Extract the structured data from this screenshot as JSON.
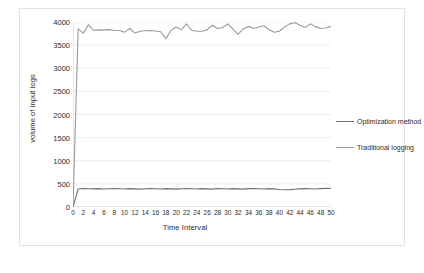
{
  "chart_data": {
    "type": "line",
    "title": "",
    "xlabel": "Time Interval",
    "ylabel": "volume of input logs",
    "xlim": [
      0,
      50
    ],
    "ylim": [
      0,
      4000
    ],
    "ytick_step": 500,
    "xtick_step": 2,
    "grid": true,
    "legend_position": "right",
    "yticks": [
      0,
      500,
      1000,
      1500,
      2000,
      2500,
      3000,
      3500,
      4000
    ],
    "xticks": [
      0,
      2,
      4,
      6,
      8,
      10,
      12,
      14,
      16,
      18,
      20,
      22,
      24,
      26,
      28,
      30,
      32,
      34,
      36,
      38,
      40,
      42,
      44,
      46,
      48,
      50
    ],
    "x": [
      0,
      1,
      2,
      3,
      4,
      5,
      6,
      7,
      8,
      9,
      10,
      11,
      12,
      13,
      14,
      15,
      16,
      17,
      18,
      19,
      20,
      21,
      22,
      23,
      24,
      25,
      26,
      27,
      28,
      29,
      30,
      31,
      32,
      33,
      34,
      35,
      36,
      37,
      38,
      39,
      40,
      41,
      42,
      43,
      44,
      45,
      46,
      47,
      48,
      49,
      50
    ],
    "series": [
      {
        "name": "Optimization method",
        "color": "#6f6f6f",
        "values": [
          0,
          390,
          400,
          395,
          392,
          398,
          388,
          396,
          400,
          394,
          390,
          398,
          392,
          386,
          396,
          400,
          393,
          388,
          398,
          392,
          386,
          396,
          401,
          394,
          388,
          397,
          392,
          387,
          399,
          393,
          388,
          398,
          392,
          386,
          397,
          401,
          394,
          389,
          398,
          392,
          380,
          372,
          376,
          384,
          392,
          398,
          394,
          390,
          398,
          402,
          400
        ]
      },
      {
        "name": "Traditional logging",
        "color": "#9a9a9a",
        "values": [
          0,
          3850,
          3760,
          3940,
          3820,
          3830,
          3825,
          3835,
          3820,
          3815,
          3780,
          3860,
          3760,
          3800,
          3810,
          3815,
          3805,
          3790,
          3640,
          3820,
          3890,
          3835,
          3960,
          3820,
          3800,
          3800,
          3830,
          3930,
          3860,
          3880,
          3960,
          3845,
          3730,
          3855,
          3900,
          3860,
          3890,
          3920,
          3830,
          3780,
          3800,
          3890,
          3960,
          3985,
          3930,
          3880,
          3960,
          3900,
          3860,
          3870,
          3905
        ]
      }
    ]
  },
  "legend": {
    "items": [
      {
        "label": "Optimization method"
      },
      {
        "label": "Traditional logging"
      }
    ]
  }
}
